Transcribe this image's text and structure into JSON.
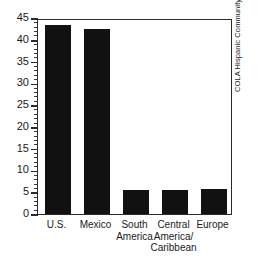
{
  "figure": {
    "header_remnant": "",
    "source_caption": "COLA Hispanic Community Survey, 1978."
  },
  "chart_data": {
    "type": "bar",
    "title": "",
    "xlabel": "",
    "ylabel": "",
    "categories": [
      "U.S.",
      "Mexico",
      "South America",
      "Central America/ Caribbean",
      "Europe"
    ],
    "category_lines": [
      [
        "U.S."
      ],
      [
        "Mexico"
      ],
      [
        "South",
        "America"
      ],
      [
        "Central",
        "America/",
        "Caribbean"
      ],
      [
        "Europe"
      ]
    ],
    "values": [
      43.5,
      42.5,
      5.5,
      5.5,
      5.7
    ],
    "ylim": [
      0,
      45
    ],
    "yticks": [
      0,
      5,
      10,
      15,
      20,
      25,
      30,
      35,
      40,
      45
    ],
    "ytick_labels": [
      "0",
      "5",
      "10",
      "15",
      "20",
      "25",
      "30",
      "35",
      "40",
      "45"
    ],
    "yminor_step": 1,
    "grid": false,
    "legend": false,
    "bar_color": "#111111",
    "frame_color": "#2a2a2a"
  }
}
